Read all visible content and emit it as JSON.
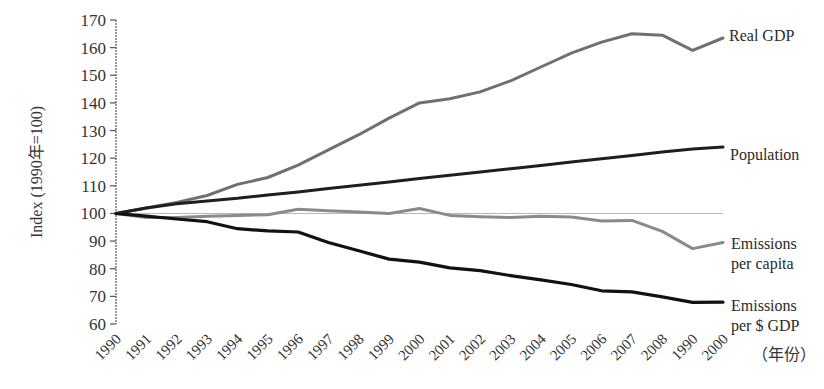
{
  "chart_data": {
    "type": "line",
    "title": "",
    "xlabel": "（年份）",
    "ylabel": "Index (1990年=100)",
    "ylim": [
      60,
      170
    ],
    "yticks": [
      60,
      70,
      80,
      90,
      100,
      110,
      120,
      130,
      140,
      150,
      160,
      170
    ],
    "grid": false,
    "reference_line": 100,
    "legend_position": "inline-right",
    "categories": [
      "1990",
      "1991",
      "1992",
      "1993",
      "1994",
      "1995",
      "1996",
      "1997",
      "1998",
      "1999",
      "2000",
      "2001",
      "2002",
      "2003",
      "2004",
      "2005",
      "2006",
      "2007",
      "2008",
      "1990",
      "2000"
    ],
    "series": [
      {
        "name": "Real GDP",
        "color": "#707070",
        "width": 3,
        "values": [
          100,
          102,
          104,
          106.5,
          110.5,
          113,
          117.5,
          123,
          128.5,
          134.5,
          140,
          141.5,
          144,
          148,
          153,
          158,
          162,
          165,
          164.5,
          159,
          163.5
        ]
      },
      {
        "name": "Population",
        "color": "#1e1e1e",
        "width": 3,
        "values": [
          100,
          102,
          103.5,
          104.5,
          105.5,
          106.7,
          107.8,
          109,
          110.2,
          111.4,
          112.6,
          113.8,
          115,
          116.2,
          117.4,
          118.6,
          119.8,
          121,
          122.2,
          123.3,
          124
        ]
      },
      {
        "name": "Emissions per capita",
        "color": "#8a8a8a",
        "width": 3,
        "values": [
          100,
          98.5,
          98.5,
          99,
          99.3,
          99.5,
          101.5,
          101,
          100.5,
          100,
          101.8,
          99.3,
          98.8,
          98.5,
          99,
          98.7,
          97.3,
          97.5,
          93.5,
          87.3,
          89.5
        ]
      },
      {
        "name": "Emissions per $ GDP",
        "color": "#111111",
        "width": 3.2,
        "values": [
          100,
          99,
          98,
          97,
          94.5,
          93.7,
          93.3,
          89.5,
          86.5,
          83.5,
          82.4,
          80.3,
          79.3,
          77.5,
          76,
          74.3,
          72,
          71.6,
          69.8,
          67.8,
          67.9
        ]
      }
    ],
    "series_labels": [
      {
        "lines": [
          "Real GDP"
        ]
      },
      {
        "lines": [
          "Population"
        ]
      },
      {
        "lines": [
          "Emissions",
          "per capita"
        ]
      },
      {
        "lines": [
          "Emissions",
          "per  $ GDP"
        ]
      }
    ]
  }
}
